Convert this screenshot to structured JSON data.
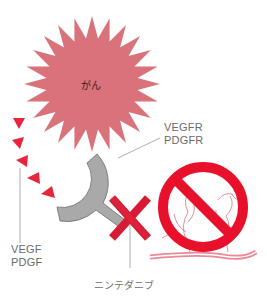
{
  "diagram": {
    "type": "mechanism-of-action",
    "nodes": {
      "cancer": {
        "label": "がん",
        "shape": "starburst",
        "color": "#d9727a"
      },
      "growth_factors": {
        "label_line1": "VEGF",
        "label_line2": "PDGF",
        "shape": "triangles",
        "color": "#e8263b",
        "count": 7
      },
      "receptor": {
        "label_line1": "VEGFR",
        "label_line2": "PDGFR",
        "shape": "y-receptor",
        "color": "#a9a9a9"
      },
      "drug": {
        "label": "ニンテダニブ",
        "shape": "x-mark",
        "color": "#d81b34"
      },
      "angiogenesis_blocked": {
        "shape": "prohibition-sign",
        "color": "#e8102a",
        "vessel_color": "#e98a96"
      }
    },
    "colors": {
      "label_text": "#6a6a6a",
      "leader_line": "#9a9a9a",
      "background": "#ffffff"
    }
  }
}
